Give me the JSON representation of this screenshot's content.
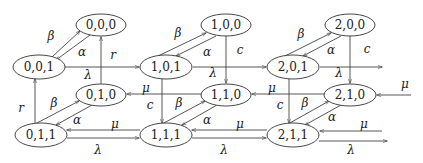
{
  "diagram": {
    "type": "state-transition-diagram",
    "nodes": [
      {
        "id": "000",
        "label": "0,0,0",
        "x": 101,
        "y": 25
      },
      {
        "id": "100",
        "label": "1,0,0",
        "x": 226,
        "y": 25
      },
      {
        "id": "200",
        "label": "2,0,0",
        "x": 350,
        "y": 25
      },
      {
        "id": "001",
        "label": "0,0,1",
        "x": 33,
        "y": 67
      },
      {
        "id": "101",
        "label": "1,0,1",
        "x": 166,
        "y": 67
      },
      {
        "id": "201",
        "label": "2,0,1",
        "x": 293,
        "y": 67
      },
      {
        "id": "010",
        "label": "0,1,0",
        "x": 101,
        "y": 95
      },
      {
        "id": "110",
        "label": "1,1,0",
        "x": 226,
        "y": 95
      },
      {
        "id": "210",
        "label": "2,1,0",
        "x": 350,
        "y": 95
      },
      {
        "id": "011",
        "label": "0,1,1",
        "x": 41,
        "y": 135
      },
      {
        "id": "111",
        "label": "1,1,1",
        "x": 166,
        "y": 135
      },
      {
        "id": "211",
        "label": "2,1,1",
        "x": 293,
        "y": 135
      }
    ],
    "edge_labels": {
      "beta": "β",
      "alpha": "α",
      "lambda": "λ",
      "mu": "μ",
      "r": "r",
      "c": "c"
    },
    "edges": [
      {
        "from": "001",
        "to": "000",
        "label": "β"
      },
      {
        "from": "000",
        "to": "001",
        "label": "α"
      },
      {
        "from": "101",
        "to": "100",
        "label": "β"
      },
      {
        "from": "100",
        "to": "101",
        "label": "α"
      },
      {
        "from": "201",
        "to": "200",
        "label": "β"
      },
      {
        "from": "200",
        "to": "201",
        "label": "α"
      },
      {
        "from": "011",
        "to": "010",
        "label": "β"
      },
      {
        "from": "010",
        "to": "011",
        "label": "α"
      },
      {
        "from": "111",
        "to": "110",
        "label": "β"
      },
      {
        "from": "110",
        "to": "111",
        "label": "α"
      },
      {
        "from": "211",
        "to": "210",
        "label": "β"
      },
      {
        "from": "210",
        "to": "211",
        "label": "α"
      },
      {
        "from": "001",
        "to": "101",
        "label": "λ"
      },
      {
        "from": "101",
        "to": "201",
        "label": "λ"
      },
      {
        "from": "201",
        "to": "out",
        "label": "λ"
      },
      {
        "from": "011",
        "to": "111",
        "label": "λ"
      },
      {
        "from": "111",
        "to": "211",
        "label": "λ"
      },
      {
        "from": "211",
        "to": "out",
        "label": "λ"
      },
      {
        "from": "111",
        "to": "011",
        "label": "μ"
      },
      {
        "from": "211",
        "to": "111",
        "label": "μ"
      },
      {
        "from": "in",
        "to": "211",
        "label": "μ"
      },
      {
        "from": "110",
        "to": "010",
        "label": "μ"
      },
      {
        "from": "210",
        "to": "110",
        "label": "μ"
      },
      {
        "from": "in",
        "to": "210",
        "label": "μ"
      },
      {
        "from": "010",
        "to": "000",
        "label": "r"
      },
      {
        "from": "011",
        "to": "001",
        "label": "r"
      },
      {
        "from": "100",
        "to": "110",
        "label": "c"
      },
      {
        "from": "200",
        "to": "210",
        "label": "c"
      },
      {
        "from": "101",
        "to": "111",
        "label": "c"
      },
      {
        "from": "201",
        "to": "211",
        "label": "c"
      }
    ]
  }
}
